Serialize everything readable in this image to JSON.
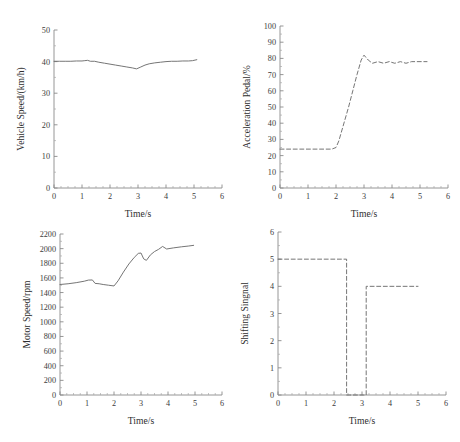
{
  "figure": {
    "background_color": "#ffffff",
    "line_color": "#6e6e6e",
    "axis_color": "#8a8a8a",
    "text_color": "#2e2e2e",
    "caption_remnant": "",
    "panels": [
      "vehicle-speed",
      "acceleration-pedal",
      "motor-speed",
      "shifting-signal"
    ]
  },
  "chart_data": [
    {
      "id": "vehicle-speed",
      "type": "line",
      "title": "",
      "xlabel": "Time/s",
      "ylabel": "Vehicle Speed/(km/h)",
      "xlim": [
        0,
        6
      ],
      "ylim": [
        0,
        50
      ],
      "xticks": [
        0,
        1,
        2,
        3,
        4,
        5,
        6
      ],
      "yticks": [
        0,
        10,
        20,
        30,
        40,
        50
      ],
      "xminor_step": 0.25,
      "yminor_step": 5,
      "grid": false,
      "legend": "none",
      "linestyle": "solid",
      "x": [
        0.0,
        0.2,
        0.4,
        0.6,
        0.8,
        1.0,
        1.1,
        1.2,
        1.3,
        1.45,
        1.6,
        1.8,
        2.0,
        2.2,
        2.4,
        2.6,
        2.8,
        2.95,
        3.1,
        3.25,
        3.4,
        3.6,
        3.8,
        4.0,
        4.2,
        4.4,
        4.6,
        4.8,
        4.95,
        5.1
      ],
      "y": [
        40.1,
        40.1,
        40.1,
        40.1,
        40.2,
        40.2,
        40.3,
        40.4,
        40.1,
        40.1,
        39.8,
        39.5,
        39.2,
        38.9,
        38.6,
        38.3,
        38.0,
        37.7,
        38.3,
        38.9,
        39.3,
        39.6,
        39.8,
        40.0,
        40.1,
        40.1,
        40.2,
        40.2,
        40.3,
        40.6
      ]
    },
    {
      "id": "acceleration-pedal",
      "type": "line",
      "title": "",
      "xlabel": "Time/s",
      "ylabel": "Acceleration Pedal/%",
      "xlim": [
        0,
        6
      ],
      "ylim": [
        0,
        100
      ],
      "xticks": [
        0,
        1,
        2,
        3,
        4,
        5,
        6
      ],
      "yticks": [
        0,
        10,
        20,
        30,
        40,
        50,
        60,
        70,
        80,
        90,
        100
      ],
      "xminor_step": 0.25,
      "yminor_step": 5,
      "grid": false,
      "legend": "none",
      "linestyle": "dashed",
      "x": [
        0.0,
        0.5,
        1.0,
        1.5,
        1.85,
        2.0,
        2.1,
        2.25,
        2.45,
        2.6,
        2.75,
        2.9,
        3.0,
        3.15,
        3.3,
        3.5,
        3.7,
        3.9,
        4.1,
        4.3,
        4.5,
        4.7,
        4.9,
        5.1,
        5.25
      ],
      "y": [
        24,
        24,
        24,
        24,
        24,
        25,
        29,
        38,
        50,
        60,
        70,
        79,
        82,
        79,
        77,
        78,
        77,
        78,
        77,
        78,
        77,
        78,
        78,
        78,
        78
      ]
    },
    {
      "id": "motor-speed",
      "type": "line",
      "title": "",
      "xlabel": "Time/s",
      "ylabel": "Motor Speed/rpm",
      "xlim": [
        0,
        6
      ],
      "ylim": [
        0,
        2200
      ],
      "xticks": [
        0,
        1,
        2,
        3,
        4,
        5,
        6
      ],
      "yticks": [
        0,
        200,
        400,
        600,
        800,
        1000,
        1200,
        1400,
        1600,
        1800,
        2000,
        2200
      ],
      "xminor_step": 0.25,
      "yminor_step": 100,
      "grid": false,
      "legend": "none",
      "linestyle": "solid",
      "x": [
        0.0,
        0.3,
        0.6,
        0.9,
        1.05,
        1.2,
        1.3,
        1.45,
        1.6,
        1.8,
        2.0,
        2.15,
        2.35,
        2.55,
        2.75,
        2.9,
        3.0,
        3.1,
        3.2,
        3.35,
        3.5,
        3.65,
        3.8,
        3.95,
        4.2,
        4.5,
        4.75,
        4.95
      ],
      "y": [
        1510,
        1520,
        1535,
        1555,
        1570,
        1572,
        1525,
        1520,
        1510,
        1500,
        1490,
        1560,
        1680,
        1790,
        1880,
        1935,
        1940,
        1860,
        1840,
        1915,
        1960,
        1990,
        2030,
        1995,
        2010,
        2025,
        2035,
        2045
      ]
    },
    {
      "id": "shifting-signal",
      "type": "line",
      "title": "",
      "xlabel": "Time/s",
      "ylabel": "Shifting Singnal",
      "xlim": [
        0,
        6
      ],
      "ylim": [
        0,
        6
      ],
      "xticks": [
        0,
        1,
        2,
        3,
        4,
        5,
        6
      ],
      "yticks": [
        0,
        1,
        2,
        3,
        4,
        5,
        6
      ],
      "xminor_step": 0.25,
      "yminor_step": 0.5,
      "grid": false,
      "legend": "none",
      "linestyle": "dashed",
      "x": [
        0.0,
        2.45,
        2.45,
        2.55,
        2.55,
        3.05,
        3.05,
        3.15,
        3.15,
        5.0
      ],
      "y": [
        5,
        5,
        0,
        0,
        0,
        0,
        0,
        0,
        4,
        4
      ]
    }
  ]
}
